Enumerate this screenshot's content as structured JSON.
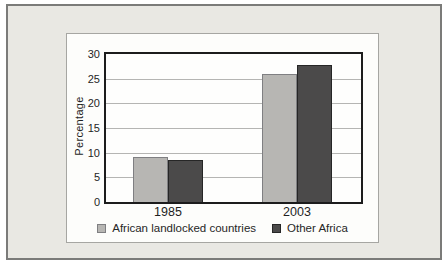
{
  "figure": {
    "frame_background": "#e9e8e3",
    "frame_border_color": "#7b7b79",
    "panel_background": "#fdfdfb",
    "panel_border_color": "#a6a6a2",
    "plot_border_color": "#1c1c1c",
    "gridline_color": "#b5b5b3"
  },
  "chart_data": {
    "type": "bar",
    "title": "",
    "categories": [
      "1985",
      "2003"
    ],
    "series": [
      {
        "name": "African landlocked countries",
        "values": [
          9.2,
          26.0
        ],
        "color": "#b7b6b3",
        "border_color": "#7f7f82"
      },
      {
        "name": "Other Africa",
        "values": [
          8.6,
          27.8
        ],
        "color": "#4b4a4a",
        "border_color": "#262626"
      }
    ],
    "xlabel": "",
    "ylabel": "Percentage",
    "ylim": [
      0,
      30
    ],
    "yticks": [
      0,
      5,
      10,
      15,
      20,
      25,
      30
    ],
    "grid": true,
    "legend_position": "bottom"
  }
}
